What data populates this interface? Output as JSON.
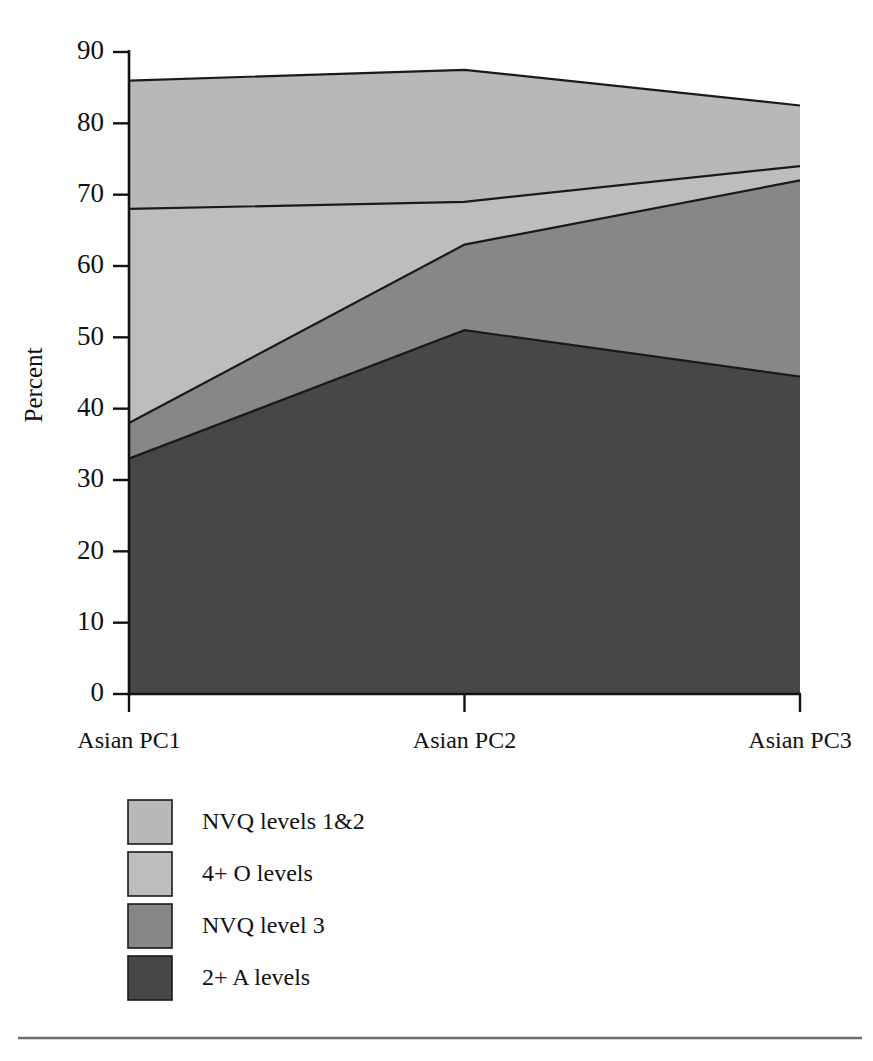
{
  "chart_data": {
    "type": "area",
    "title": "",
    "subtitle": "",
    "xlabel": "",
    "ylabel": "Percent",
    "categories": [
      "Asian PC1",
      "Asian PC2",
      "Asian PC3"
    ],
    "ylim": [
      0,
      90
    ],
    "yticks": [
      0,
      10,
      20,
      30,
      40,
      50,
      60,
      70,
      80,
      90
    ],
    "ytick_labels": [
      "0",
      "10",
      "20",
      "30",
      "40",
      "50",
      "60",
      "70",
      "80",
      "90"
    ],
    "grid": false,
    "stacked": true,
    "values_are_cumulative": true,
    "legend_position": "below-axes-left",
    "series": [
      {
        "name": "NVQ levels 1&2",
        "color": "#b8b8b8",
        "values": [
          86.0,
          87.5,
          82.5
        ]
      },
      {
        "name": "4+ O levels",
        "color": "#bdbdbd",
        "values": [
          68.0,
          69.0,
          74.0
        ]
      },
      {
        "name": "NVQ level 3",
        "color": "#878787",
        "values": [
          38.0,
          63.0,
          72.0
        ]
      },
      {
        "name": "2+ A levels",
        "color": "#474747",
        "values": [
          33.0,
          51.0,
          44.5
        ]
      }
    ],
    "annotations": []
  },
  "axes": {
    "y_axis_title": "Percent",
    "y_tick_labels": [
      "90",
      "80",
      "70",
      "60",
      "50",
      "40",
      "30",
      "20",
      "10",
      "0"
    ],
    "x_tick_labels": [
      "Asian PC1",
      "Asian PC2",
      "Asian PC3"
    ]
  },
  "legend": {
    "items": [
      {
        "label": "NVQ levels 1&2",
        "color": "#b8b8b8"
      },
      {
        "label": "4+ O levels",
        "color": "#bdbdbd"
      },
      {
        "label": "NVQ level 3",
        "color": "#878787"
      },
      {
        "label": "2+ A levels",
        "color": "#474747"
      }
    ]
  },
  "footer": {
    "rule_color": "#6e6e6e"
  }
}
